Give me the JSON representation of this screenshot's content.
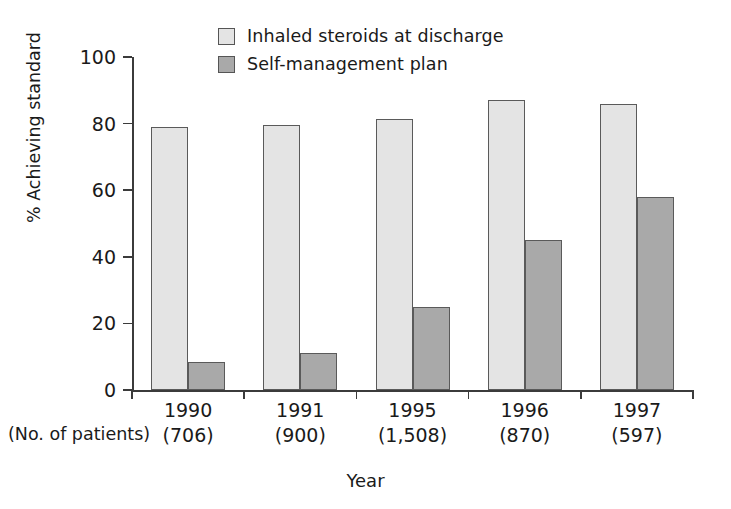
{
  "chart_data": {
    "type": "bar",
    "title": "",
    "xlabel": "Year",
    "ylabel": "% Achieving standard",
    "ylim": [
      0,
      100
    ],
    "yticks": [
      0,
      20,
      40,
      60,
      80,
      100
    ],
    "grid": false,
    "legend_position": "top-center",
    "categories": [
      "1990",
      "1991",
      "1995",
      "1996",
      "1997"
    ],
    "category_sublabels": [
      "(706)",
      "(900)",
      "(1,508)",
      "(870)",
      "(597)"
    ],
    "category_sublabel_caption": "(No. of patients)",
    "series": [
      {
        "name": "Inhaled steroids at discharge",
        "color": "#e4e4e4",
        "values": [
          79,
          79.5,
          81.5,
          87,
          86
        ]
      },
      {
        "name": "Self-management plan",
        "color": "#a9a9a9",
        "values": [
          8.5,
          11,
          25,
          45,
          58
        ]
      }
    ]
  },
  "legend": {
    "items": [
      {
        "label": "Inhaled steroids at discharge",
        "swatch": "light-gray-square"
      },
      {
        "label": "Self-management plan",
        "swatch": "dark-gray-square"
      }
    ]
  },
  "axes": {
    "y_title": "% Achieving standard",
    "x_title": "Year",
    "y_tick_labels": [
      "100",
      "80",
      "60",
      "40",
      "20",
      "0"
    ]
  },
  "x_axis_labels": [
    {
      "year": "1990",
      "count": "(706)"
    },
    {
      "year": "1991",
      "count": "(900)"
    },
    {
      "year": "1995",
      "count": "(1,508)"
    },
    {
      "year": "1996",
      "count": "(870)"
    },
    {
      "year": "1997",
      "count": "(597)"
    }
  ],
  "patients_caption": "(No. of patients)"
}
